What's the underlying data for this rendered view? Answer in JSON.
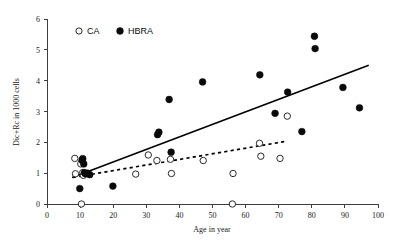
{
  "chart_data": {
    "type": "scatter",
    "title": "",
    "xlabel": "Age in year",
    "ylabel": "Dic+Rc in 1000 cells",
    "xlim": [
      0,
      100
    ],
    "ylim": [
      0,
      6
    ],
    "xticks": [
      0,
      10,
      20,
      30,
      40,
      50,
      60,
      70,
      80,
      90,
      100
    ],
    "yticks": [
      0,
      1,
      2,
      3,
      4,
      5,
      6
    ],
    "xtick_labels": [
      "0",
      "10",
      "20",
      "30",
      "40",
      "50",
      "60",
      "70",
      "80",
      "90",
      "100"
    ],
    "ytick_labels": [
      "0",
      "1",
      "2",
      "3",
      "4",
      "5",
      "6"
    ],
    "grid": false,
    "legend_position": "top-left",
    "legend": [
      {
        "name": "CA",
        "marker": "open-circle",
        "color": "#ffffff",
        "edge": "#2b2b2b"
      },
      {
        "name": "HBRA",
        "marker": "filled-circle",
        "color": "#0a0a0a",
        "edge": "#0a0a0a"
      }
    ],
    "series": [
      {
        "name": "CA",
        "marker": "open-circle",
        "points": [
          [
            8.4,
            1.48
          ],
          [
            8.6,
            0.98
          ],
          [
            10.2,
            1.3
          ],
          [
            10.4,
            0.0
          ],
          [
            10.8,
            1.02
          ],
          [
            11.0,
            0.93
          ],
          [
            26.8,
            0.97
          ],
          [
            30.6,
            1.59
          ],
          [
            33.2,
            1.41
          ],
          [
            37.3,
            1.45
          ],
          [
            37.6,
            0.99
          ],
          [
            47.2,
            1.41
          ],
          [
            56.0,
            0.0
          ],
          [
            56.2,
            0.99
          ],
          [
            64.2,
            1.97
          ],
          [
            64.6,
            1.55
          ],
          [
            70.4,
            1.48
          ],
          [
            72.6,
            2.85
          ]
        ]
      },
      {
        "name": "HBRA",
        "marker": "filled-circle",
        "points": [
          [
            9.9,
            0.5
          ],
          [
            10.6,
            1.42
          ],
          [
            10.8,
            1.47
          ],
          [
            11.1,
            1.3
          ],
          [
            11.3,
            1.02
          ],
          [
            11.6,
            0.98
          ],
          [
            12.3,
            1.0
          ],
          [
            12.9,
            0.95
          ],
          [
            19.9,
            0.58
          ],
          [
            33.4,
            2.25
          ],
          [
            33.8,
            2.33
          ],
          [
            36.9,
            3.39
          ],
          [
            37.5,
            1.68
          ],
          [
            47.0,
            3.96
          ],
          [
            64.3,
            4.19
          ],
          [
            68.9,
            2.94
          ],
          [
            72.7,
            3.63
          ],
          [
            77.0,
            2.35
          ],
          [
            80.8,
            5.44
          ],
          [
            81.0,
            5.04
          ],
          [
            89.4,
            3.78
          ],
          [
            94.4,
            3.12
          ]
        ]
      }
    ],
    "trendlines": [
      {
        "name": "HBRA-trend",
        "style": "solid",
        "x": [
          7.6,
          97.2
        ],
        "y": [
          0.86,
          4.5
        ]
      },
      {
        "name": "CA-trend",
        "style": "dashed",
        "x": [
          7.8,
          72.6
        ],
        "y": [
          0.86,
          2.04
        ]
      }
    ]
  }
}
